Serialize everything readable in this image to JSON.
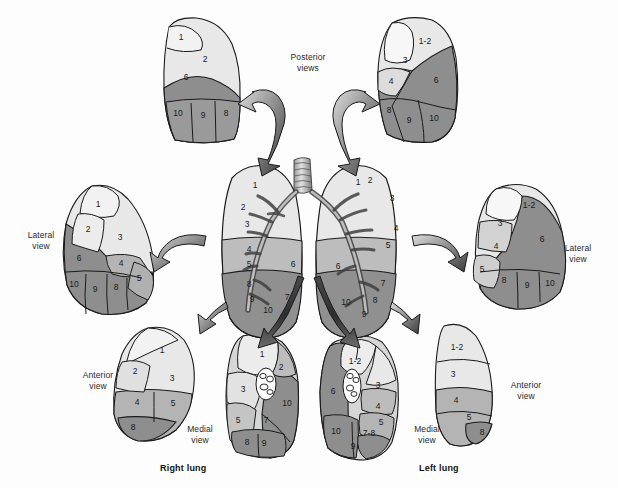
{
  "figure": {
    "title_right": "Right lung",
    "title_left": "Left lung",
    "background_color": "#fdfdfd"
  },
  "palette": {
    "upper_lobe": "#e8e8e8",
    "middle_lobe": "#b9b9b9",
    "lower_lobe": "#8e8e8e",
    "white_seg": "#f7f7f7",
    "outline": "#1a1a1a",
    "arrow_dark": "#3a3a3a",
    "arrow_light": "#d8d8d8",
    "text": "#1a1a1a"
  },
  "labels": {
    "posterior_views": "Posterior\nviews",
    "lateral_view": "Lateral\nview",
    "anterior_view": "Anterior\nview",
    "medial_view": "Medial\nview"
  },
  "views": {
    "posterior_right": {
      "name": "Right lung posterior view",
      "segments": [
        "1",
        "2",
        "6",
        "10",
        "9",
        "8"
      ]
    },
    "posterior_left": {
      "name": "Left lung posterior view",
      "segments": [
        "1-2",
        "3",
        "4",
        "6",
        "8",
        "9",
        "10"
      ]
    },
    "lateral_right": {
      "name": "Right lung lateral view",
      "segments": [
        "1",
        "2",
        "3",
        "6",
        "4",
        "5",
        "10",
        "9",
        "8"
      ]
    },
    "lateral_left": {
      "name": "Left lung lateral view",
      "segments": [
        "1-2",
        "3",
        "4",
        "6",
        "5",
        "8",
        "9",
        "10"
      ]
    },
    "anterior_right": {
      "name": "Right lung anterior view",
      "segments": [
        "1",
        "2",
        "3",
        "4",
        "5",
        "8"
      ]
    },
    "anterior_left": {
      "name": "Left lung anterior view",
      "segments": [
        "1-2",
        "3",
        "4",
        "5",
        "8"
      ]
    },
    "medial_right": {
      "name": "Right lung medial view",
      "segments": [
        "1",
        "2",
        "3",
        "5",
        "7",
        "8",
        "9",
        "10"
      ]
    },
    "medial_left": {
      "name": "Left lung medial view",
      "segments": [
        "1-2",
        "3",
        "6",
        "4",
        "5",
        "10",
        "7-8",
        "9"
      ]
    },
    "central_right": {
      "name": "Right lung with bronchial tree",
      "segments": [
        "1",
        "2",
        "3",
        "4",
        "5",
        "6",
        "8",
        "9",
        "7",
        "10"
      ]
    },
    "central_left": {
      "name": "Left lung with bronchial tree",
      "segments": [
        "1",
        "2",
        "3",
        "4",
        "5",
        "6",
        "7",
        "10",
        "8",
        "9"
      ]
    }
  },
  "segment_positions": {
    "posterior_right": [
      {
        "t": "1",
        "x": 181,
        "y": 38
      },
      {
        "t": "2",
        "x": 205,
        "y": 60
      },
      {
        "t": "6",
        "x": 186,
        "y": 78
      },
      {
        "t": "10",
        "x": 178,
        "y": 114
      },
      {
        "t": "9",
        "x": 203,
        "y": 116
      },
      {
        "t": "8",
        "x": 226,
        "y": 114
      }
    ],
    "posterior_left": [
      {
        "t": "1-2",
        "x": 425,
        "y": 42
      },
      {
        "t": "3",
        "x": 405,
        "y": 61
      },
      {
        "t": "4",
        "x": 391,
        "y": 82
      },
      {
        "t": "6",
        "x": 436,
        "y": 81
      },
      {
        "t": "8",
        "x": 389,
        "y": 111
      },
      {
        "t": "9",
        "x": 409,
        "y": 121
      },
      {
        "t": "10",
        "x": 434,
        "y": 119
      }
    ],
    "lateral_right": [
      {
        "t": "1",
        "x": 98,
        "y": 205
      },
      {
        "t": "2",
        "x": 88,
        "y": 230
      },
      {
        "t": "3",
        "x": 120,
        "y": 238
      },
      {
        "t": "6",
        "x": 79,
        "y": 259
      },
      {
        "t": "4",
        "x": 121,
        "y": 264
      },
      {
        "t": "5",
        "x": 139,
        "y": 279
      },
      {
        "t": "10",
        "x": 74,
        "y": 285
      },
      {
        "t": "9",
        "x": 95,
        "y": 290
      },
      {
        "t": "8",
        "x": 116,
        "y": 288
      }
    ],
    "lateral_left": [
      {
        "t": "1-2",
        "x": 529,
        "y": 206
      },
      {
        "t": "3",
        "x": 500,
        "y": 224
      },
      {
        "t": "4",
        "x": 496,
        "y": 247
      },
      {
        "t": "6",
        "x": 542,
        "y": 240
      },
      {
        "t": "5",
        "x": 482,
        "y": 270
      },
      {
        "t": "8",
        "x": 504,
        "y": 281
      },
      {
        "t": "9",
        "x": 527,
        "y": 286
      },
      {
        "t": "10",
        "x": 550,
        "y": 284
      }
    ],
    "anterior_right": [
      {
        "t": "1",
        "x": 162,
        "y": 351
      },
      {
        "t": "2",
        "x": 135,
        "y": 372
      },
      {
        "t": "3",
        "x": 172,
        "y": 379
      },
      {
        "t": "4",
        "x": 137,
        "y": 403
      },
      {
        "t": "5",
        "x": 173,
        "y": 404
      },
      {
        "t": "8",
        "x": 133,
        "y": 428
      }
    ],
    "anterior_left": [
      {
        "t": "1-2",
        "x": 457,
        "y": 348
      },
      {
        "t": "3",
        "x": 453,
        "y": 375
      },
      {
        "t": "4",
        "x": 456,
        "y": 401
      },
      {
        "t": "5",
        "x": 469,
        "y": 418
      },
      {
        "t": "8",
        "x": 482,
        "y": 433
      }
    ],
    "medial_right": [
      {
        "t": "1",
        "x": 262,
        "y": 355
      },
      {
        "t": "2",
        "x": 281,
        "y": 368
      },
      {
        "t": "3",
        "x": 243,
        "y": 390
      },
      {
        "t": "10",
        "x": 287,
        "y": 404
      },
      {
        "t": "5",
        "x": 238,
        "y": 421
      },
      {
        "t": "7",
        "x": 266,
        "y": 421
      },
      {
        "t": "8",
        "x": 247,
        "y": 443
      },
      {
        "t": "9",
        "x": 264,
        "y": 444
      }
    ],
    "medial_left": [
      {
        "t": "1-2",
        "x": 355,
        "y": 362
      },
      {
        "t": "3",
        "x": 378,
        "y": 386
      },
      {
        "t": "6",
        "x": 333,
        "y": 392
      },
      {
        "t": "4",
        "x": 378,
        "y": 407
      },
      {
        "t": "5",
        "x": 381,
        "y": 423
      },
      {
        "t": "10",
        "x": 336,
        "y": 432
      },
      {
        "t": "7-8",
        "x": 369,
        "y": 434
      },
      {
        "t": "9",
        "x": 353,
        "y": 447
      }
    ],
    "central_right": [
      {
        "t": "1",
        "x": 255,
        "y": 186
      },
      {
        "t": "2",
        "x": 243,
        "y": 208
      },
      {
        "t": "3",
        "x": 247,
        "y": 225
      },
      {
        "t": "4",
        "x": 249,
        "y": 250
      },
      {
        "t": "5",
        "x": 249,
        "y": 265
      },
      {
        "t": "6",
        "x": 293,
        "y": 265
      },
      {
        "t": "8",
        "x": 249,
        "y": 285
      },
      {
        "t": "9",
        "x": 252,
        "y": 300
      },
      {
        "t": "7",
        "x": 287,
        "y": 298
      },
      {
        "t": "10",
        "x": 268,
        "y": 311
      }
    ],
    "central_left": [
      {
        "t": "1",
        "x": 358,
        "y": 183
      },
      {
        "t": "2",
        "x": 370,
        "y": 181
      },
      {
        "t": "3",
        "x": 392,
        "y": 199
      },
      {
        "t": "4",
        "x": 396,
        "y": 229
      },
      {
        "t": "5",
        "x": 388,
        "y": 246
      },
      {
        "t": "6",
        "x": 338,
        "y": 267
      },
      {
        "t": "7",
        "x": 383,
        "y": 284
      },
      {
        "t": "10",
        "x": 346,
        "y": 303
      },
      {
        "t": "8",
        "x": 375,
        "y": 301
      },
      {
        "t": "9",
        "x": 364,
        "y": 315
      }
    ]
  }
}
